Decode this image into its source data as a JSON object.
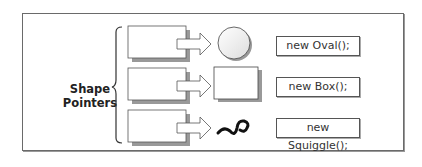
{
  "diagram": {
    "group_label_line1": "Shape",
    "group_label_line2": "Pointers",
    "rows": [
      {
        "shape": "oval",
        "label": "new Oval();"
      },
      {
        "shape": "box",
        "label": "new Box();"
      },
      {
        "shape": "squiggle",
        "label": "new Squiggle();"
      }
    ]
  }
}
